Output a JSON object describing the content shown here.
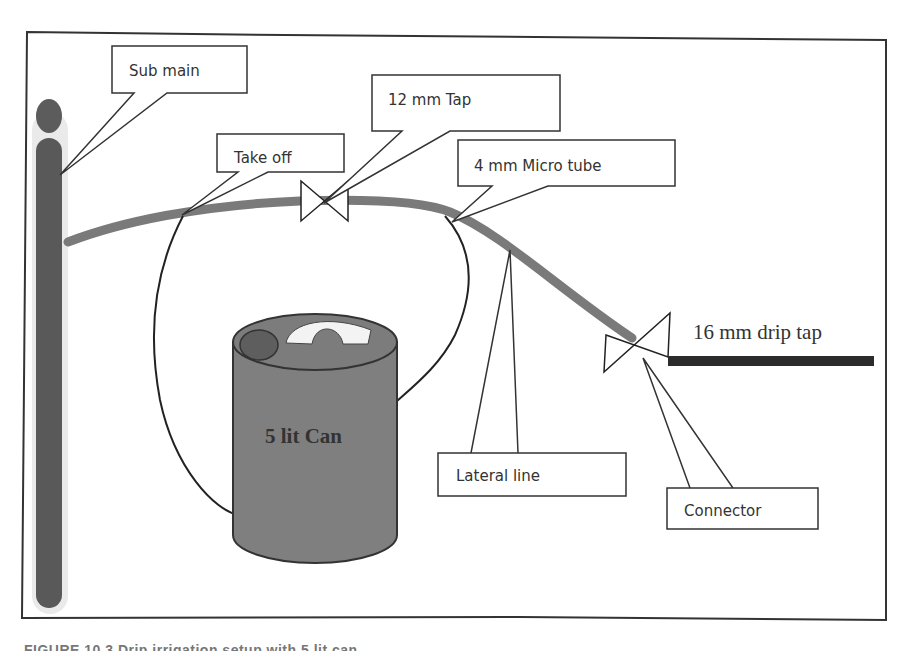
{
  "diagram": {
    "type": "drip-irrigation-schematic",
    "frame": {
      "stroke": "#333333"
    },
    "colors": {
      "pipe": "#7a7a7a",
      "submain": "#595959",
      "can_body": "#7f7f7f",
      "can_cap": "#5e5e5e",
      "drip_tap_line": "#2b2b2b",
      "outline": "#222222",
      "background": "#ffffff"
    },
    "callouts": {
      "sub_main": "Sub main",
      "take_off": "Take off",
      "tap_12mm": "12 mm Tap",
      "micro_tube_4mm": "4 mm Micro tube",
      "lateral_line": "Lateral line",
      "connector": "Connector"
    },
    "labels": {
      "drip_tap_16mm": "16 mm drip tap",
      "can": "5 lit Can"
    },
    "components": [
      {
        "name": "Sub main",
        "shape": "vertical pipe"
      },
      {
        "name": "Lateral line",
        "shape": "curved pipe"
      },
      {
        "name": "12 mm Tap",
        "shape": "valve"
      },
      {
        "name": "Take off",
        "shape": "tube junction"
      },
      {
        "name": "4 mm Micro tube",
        "shape": "tube junction"
      },
      {
        "name": "5 lit Can",
        "shape": "cylinder"
      },
      {
        "name": "Connector",
        "shape": "valve"
      },
      {
        "name": "16 mm drip tap",
        "shape": "thick line"
      }
    ]
  },
  "caption": {
    "text": "FIGURE 10.3   Drip irrigation setup with 5 lit can",
    "visible": "truncated"
  }
}
